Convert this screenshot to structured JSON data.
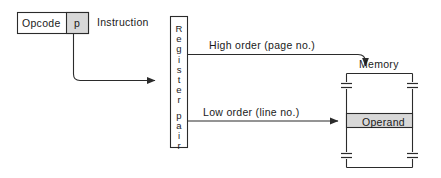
{
  "diagram": {
    "background_color": "#ffffff",
    "line_color": "#2b2b2b",
    "shade_color": "#d8d8d8",
    "text_color": "#1a1a1a"
  },
  "instruction": {
    "caption": "Instruction",
    "fields": [
      {
        "name": "opcode",
        "label": "Opcode",
        "shaded": false
      },
      {
        "name": "pointer",
        "label": "p",
        "shaded": true
      }
    ]
  },
  "register_pair": {
    "label": "Register pair",
    "letters": [
      "R",
      "e",
      "g",
      "i",
      "s",
      "t",
      "e",
      "r",
      "",
      "p",
      "a",
      "i",
      "r"
    ],
    "orientation": "vertical"
  },
  "connections": [
    {
      "name": "pointer-to-register",
      "label": "",
      "from": "instruction.pointer",
      "to": "register_pair",
      "arrowhead": "right"
    },
    {
      "name": "high-order",
      "label": "High order (page no.)",
      "from": "register_pair",
      "to": "memory",
      "arrowhead": "down"
    },
    {
      "name": "low-order",
      "label": "Low order (line no.)",
      "from": "register_pair",
      "to": "memory.operand",
      "arrowhead": "right"
    }
  ],
  "memory": {
    "label": "Memory",
    "operand_label": "Operand",
    "break_marks": 4
  }
}
